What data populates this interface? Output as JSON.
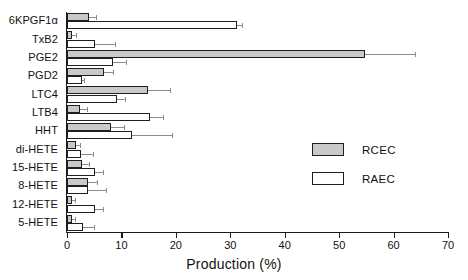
{
  "chart_data": {
    "type": "bar",
    "orientation": "horizontal",
    "title": "",
    "xlabel": "Production (%)",
    "ylabel": "",
    "xlim": [
      0,
      70
    ],
    "xticks": [
      0,
      10,
      20,
      30,
      40,
      50,
      60,
      70
    ],
    "xtick_labels": [
      "0",
      "10",
      "20",
      "30",
      "40",
      "50",
      "60",
      "70"
    ],
    "grid": false,
    "legend_position": "center-right",
    "categories": [
      "6KPGF1α",
      "TxB2",
      "PGE2",
      "PGD2",
      "LTC4",
      "LTB4",
      "HHT",
      "di-HETE",
      "15-HETE",
      "8-HETE",
      "12-HETE",
      "5-HETE"
    ],
    "series": [
      {
        "name": "RCEC",
        "color": "#c9c9c9",
        "values": [
          4.0,
          1.0,
          54.8,
          6.8,
          14.9,
          2.4,
          8.0,
          1.6,
          2.8,
          3.9,
          1.0,
          1.0
        ],
        "errors": [
          1.3,
          0.6,
          9.2,
          1.7,
          4.1,
          1.2,
          2.5,
          0.8,
          1.2,
          1.6,
          0.5,
          0.5
        ]
      },
      {
        "name": "RAEC",
        "color": "#ffffff",
        "values": [
          31.3,
          5.2,
          8.4,
          2.8,
          9.2,
          15.3,
          12.0,
          2.6,
          5.1,
          3.9,
          5.1,
          3.0
        ],
        "errors": [
          0.8,
          3.6,
          2.4,
          0.4,
          1.4,
          2.3,
          7.3,
          2.2,
          1.6,
          3.2,
          1.5,
          2.0
        ]
      }
    ]
  },
  "legend": {
    "items": [
      {
        "label": "RCEC",
        "swatch": "rcec"
      },
      {
        "label": "RAEC",
        "swatch": "raec"
      }
    ]
  }
}
